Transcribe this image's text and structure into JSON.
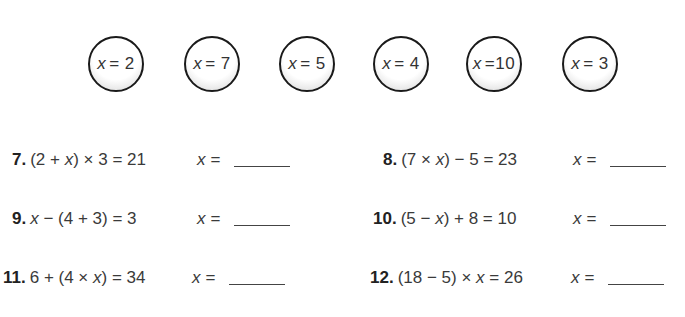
{
  "answer_choices": [
    {
      "var": "x",
      "op": "=",
      "value": "2"
    },
    {
      "var": "x",
      "op": "=",
      "value": "7"
    },
    {
      "var": "x",
      "op": "=",
      "value": "5"
    },
    {
      "var": "x",
      "op": "=",
      "value": "4"
    },
    {
      "var": "x",
      "op": "=",
      "value": "10"
    },
    {
      "var": "x",
      "op": "=",
      "value": "3"
    }
  ],
  "problems": [
    {
      "number": "7.",
      "pre": "(2 + ",
      "var": "x",
      "post": ") × 3 = 21",
      "answer_label": "x =",
      "answer": ""
    },
    {
      "number": "8.",
      "pre": "(7 × ",
      "var": "x",
      "post": ") − 5 = 23",
      "answer_label": "x =",
      "answer": ""
    },
    {
      "number": "9.",
      "pre": "",
      "var": "x",
      "post": " − (4 + 3) = 3",
      "answer_label": "x =",
      "answer": ""
    },
    {
      "number": "10.",
      "pre": "(5 − ",
      "var": "x",
      "post": ") + 8 = 10",
      "answer_label": "x =",
      "answer": ""
    },
    {
      "number": "11.",
      "pre": "6 + (4 × ",
      "var": "x",
      "post": ") = 34",
      "answer_label": "x =",
      "answer": ""
    },
    {
      "number": "12.",
      "pre": "(18 − 5) × ",
      "var": "x",
      "post": " = 26",
      "answer_label": "x =",
      "answer": ""
    }
  ]
}
